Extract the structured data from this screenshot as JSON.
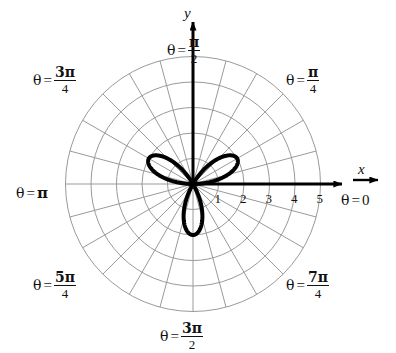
{
  "figure": {
    "background_color": "#ffffff",
    "grid_color": "#9a9a9a",
    "curve_color": "#000000",
    "axis_color": "#000000",
    "text_color": "#111111"
  },
  "axes": {
    "x_label": "x",
    "y_label": "y",
    "x_ticks": [
      {
        "label": "1",
        "value": 1
      },
      {
        "label": "2",
        "value": 2
      },
      {
        "label": "3",
        "value": 3
      },
      {
        "label": "4",
        "value": 4
      },
      {
        "label": "5",
        "value": 5
      }
    ]
  },
  "theta_labels": [
    {
      "id": "theta-0",
      "theta_text": "θ",
      "eq": "=",
      "value_text": "0",
      "numerator": "",
      "denominator": "",
      "display": "θ = 0"
    },
    {
      "id": "theta-pi-4",
      "theta_text": "θ",
      "eq": "=",
      "value_text": "",
      "numerator": "π",
      "denominator": "4",
      "display": "θ = π/4"
    },
    {
      "id": "theta-pi-2",
      "theta_text": "θ",
      "eq": "=",
      "value_text": "",
      "numerator": "π",
      "denominator": "2",
      "display": "θ = π/2"
    },
    {
      "id": "theta-3pi-4",
      "theta_text": "θ",
      "eq": "=",
      "value_text": "",
      "numerator": "3π",
      "denominator": "4",
      "display": "θ = 3π/4"
    },
    {
      "id": "theta-pi",
      "theta_text": "θ",
      "eq": "=",
      "value_text": "π",
      "numerator": "",
      "denominator": "",
      "display": "θ = π"
    },
    {
      "id": "theta-5pi-4",
      "theta_text": "θ",
      "eq": "=",
      "value_text": "",
      "numerator": "5π",
      "denominator": "4",
      "display": "θ = 5π/4"
    },
    {
      "id": "theta-3pi-2",
      "theta_text": "θ",
      "eq": "=",
      "value_text": "",
      "numerator": "3π",
      "denominator": "2",
      "display": "θ = 3π/2"
    },
    {
      "id": "theta-7pi-4",
      "theta_text": "θ",
      "eq": "=",
      "value_text": "",
      "numerator": "7π",
      "denominator": "4",
      "display": "θ = 7π/4"
    }
  ],
  "chart_data": {
    "type": "line",
    "coordinate_system": "polar",
    "title": "",
    "xlabel": "x",
    "ylabel": "y",
    "grid": true,
    "legend": null,
    "polar_grid": {
      "radial_circles": [
        1,
        2,
        3,
        4,
        5
      ],
      "radial_circle_count": 5,
      "spoke_angle_step_deg": 15,
      "spoke_count": 24,
      "r_max": 5,
      "pixels_per_unit": 25.5
    },
    "axis_ranges": {
      "r": [
        0,
        5
      ],
      "theta_deg": [
        0,
        360
      ]
    },
    "tick_labels": {
      "r": [
        "1",
        "2",
        "3",
        "4",
        "5"
      ],
      "theta": [
        "0",
        "π/4",
        "π/2",
        "3π/4",
        "π",
        "5π/4",
        "3π/2",
        "7π/4"
      ]
    },
    "series": [
      {
        "name": "three-petaled rose",
        "equation": "r = 2 sin(3θ)",
        "petal_count": 3,
        "petal_max_radius": 2,
        "petal_axis_angles_deg": [
          20,
          160,
          270
        ],
        "stroke_width_px": 4
      }
    ]
  }
}
